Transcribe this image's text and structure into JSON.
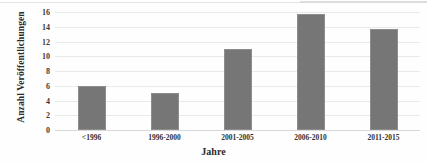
{
  "chart_data": {
    "type": "bar",
    "title": "",
    "subtitle": "",
    "xlabel": "Jahre",
    "ylabel": "Anzahl Veröffentlichungen",
    "categories": [
      "<1996",
      "1996-2000",
      "2001-2005",
      "2006-2010",
      "2011-2015"
    ],
    "values": [
      6,
      5,
      11,
      15.7,
      13.7
    ],
    "ylim": [
      0,
      16
    ],
    "yticks": [
      0,
      2,
      4,
      6,
      8,
      10,
      12,
      14,
      16
    ],
    "ytick_labels": [
      "0",
      "2",
      "4",
      "6",
      "8",
      "10",
      "12",
      "14",
      "16"
    ],
    "grid": "horizontal",
    "legend": "none",
    "bar_color": "#767676",
    "gridline_color": "#e9e9e9",
    "background_color": "#ffffff",
    "series": [
      {
        "name": "Anzahl Veröffentlichungen",
        "values": [
          6,
          5,
          11,
          15.7,
          13.7
        ]
      }
    ]
  }
}
